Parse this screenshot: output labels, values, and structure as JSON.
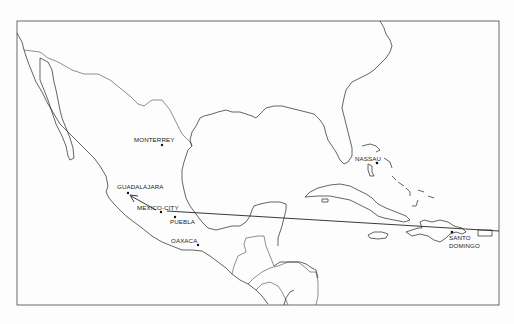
{
  "map": {
    "title_fragment": "",
    "frame": {
      "x": 17,
      "y": 21,
      "width": 482,
      "height": 284
    },
    "cities": [
      {
        "name": "MONTERREY",
        "dot": [
          162,
          145
        ],
        "label": [
          134,
          142
        ]
      },
      {
        "name": "NASSAU",
        "dot": [
          377,
          163
        ],
        "label": [
          355,
          161
        ]
      },
      {
        "name": "GUADALAJARA",
        "dot": [
          128,
          193
        ],
        "label": [
          117,
          189
        ]
      },
      {
        "name": "MEXICO-CITY",
        "dot": [
          161,
          212
        ],
        "label": [
          137,
          210
        ]
      },
      {
        "name": "PUEBLA",
        "dot": [
          175,
          217
        ],
        "label": [
          170,
          224
        ]
      },
      {
        "name": "OAXACA",
        "dot": [
          198,
          245
        ],
        "label": [
          171,
          243
        ]
      },
      {
        "name": "SANTO",
        "dot": [
          452,
          232
        ],
        "label": [
          449,
          240
        ]
      },
      {
        "name": "DOMINGO",
        "dot": null,
        "label": [
          449,
          248
        ]
      }
    ],
    "routes": [
      {
        "from": "SANTO DOMINGO",
        "to": "MEXICO-CITY",
        "points": [
          [
            499,
            231
          ],
          [
            167,
            211
          ]
        ]
      },
      {
        "from": "MEXICO-CITY",
        "to": "GUADALAJARA",
        "points": [
          [
            156,
            210
          ],
          [
            131,
            196
          ]
        ],
        "arrow": true
      }
    ],
    "colors": {
      "line": "#222222",
      "background": "#fdfdfd"
    }
  }
}
